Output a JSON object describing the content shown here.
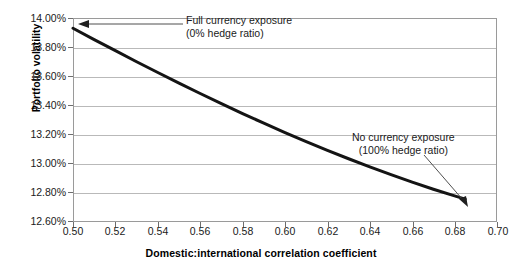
{
  "chart_data": {
    "type": "line",
    "title": "",
    "xlabel": "Domestic:international correlation coefficient",
    "ylabel": "Portfolio volatility",
    "xlim": [
      0.5,
      0.7
    ],
    "ylim": [
      12.6,
      14.0
    ],
    "grid": true,
    "legend": "none",
    "x_ticks": [
      "0.50",
      "0.52",
      "0.54",
      "0.56",
      "0.58",
      "0.60",
      "0.62",
      "0.64",
      "0.66",
      "0.68",
      "0.70"
    ],
    "y_ticks": [
      "12.60%",
      "12.80%",
      "13.00%",
      "13.20%",
      "13.40%",
      "13.60%",
      "13.80%",
      "14.00%"
    ],
    "series": [
      {
        "name": "Portfolio volatility vs correlation",
        "x": [
          0.5,
          0.51,
          0.52,
          0.53,
          0.54,
          0.55,
          0.56,
          0.57,
          0.58,
          0.59,
          0.6,
          0.61,
          0.62,
          0.63,
          0.64,
          0.65,
          0.66,
          0.67,
          0.68,
          0.685
        ],
        "values": [
          13.93,
          13.852,
          13.776,
          13.7,
          13.626,
          13.553,
          13.482,
          13.412,
          13.344,
          13.278,
          13.214,
          13.152,
          13.092,
          13.034,
          12.978,
          12.925,
          12.874,
          12.825,
          12.779,
          12.757
        ]
      }
    ],
    "annotations": [
      {
        "id": "full-currency-exposure",
        "line1": "Full currency exposure",
        "line2": "(0% hedge ratio)",
        "points_to": {
          "x": 0.5,
          "y": 13.93
        }
      },
      {
        "id": "no-currency-exposure",
        "line1": "No currency exposure",
        "line2": "(100% hedge ratio)",
        "points_to": {
          "x": 0.682,
          "y": 12.78
        }
      }
    ],
    "colors": {
      "series_line": "#141414",
      "grid": "#b9b9b9",
      "frame": "#9a9a9a",
      "annotation_arrow": "#555555",
      "text": "#1a1a1a",
      "background": "#ffffff"
    }
  }
}
